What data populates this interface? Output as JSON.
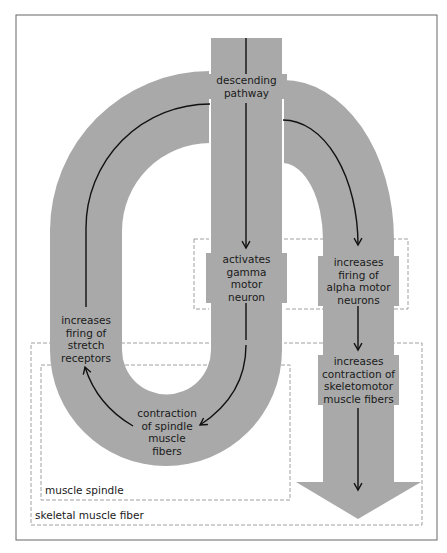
{
  "colors": {
    "band": "#a9a9a9",
    "line": "#111111",
    "frame": "#555555",
    "dashed": "#777777"
  },
  "nodes": {
    "descending": "descending\npathway",
    "gamma": "activates\ngamma\nmotor\nneuron",
    "alpha": "increases\nfiring of\nalpha motor\nneurons",
    "skeletomotor": "increases\ncontraction of\nskeletomotor\nmuscle fibers",
    "spindle_contraction": "contraction\nof spindle\nmuscle\nfibers",
    "stretch": "increases\nfiring of\nstretch\nreceptors"
  },
  "regions": {
    "muscle_spindle": "muscle spindle",
    "skeletal_muscle_fiber": "skeletal muscle fiber"
  }
}
